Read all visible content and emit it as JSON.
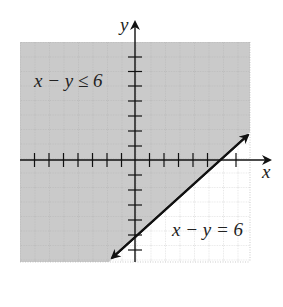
{
  "diagram": {
    "type": "linear-inequality-graph",
    "axes": {
      "x_label": "x",
      "y_label": "y",
      "x_range": [
        -8,
        8
      ],
      "y_range": [
        -8,
        8
      ],
      "tick_step": 1
    },
    "boundary_line": {
      "equation": "x − y = 6",
      "style": "solid",
      "slope": 1,
      "y_intercept": -6,
      "x_intercept": 6
    },
    "inequality": {
      "label": "x − y ≤ 6",
      "shaded_side": "above-left of line"
    },
    "colors": {
      "shade": "#c8c8c8",
      "grid": "#a0a0a0",
      "line": "#111111",
      "background": "#ffffff"
    }
  }
}
